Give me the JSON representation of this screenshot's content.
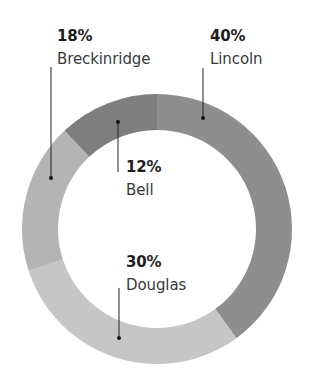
{
  "chart_data": {
    "type": "pie",
    "variant": "donut",
    "title": "",
    "start_angle_deg": 0,
    "direction": "clockwise",
    "center": [
      157,
      229
    ],
    "outer_radius": 135,
    "inner_radius": 99,
    "slices": [
      {
        "name": "Lincoln",
        "value": 40,
        "label": "40%",
        "color": "#8e8e8e",
        "label_pos": [
          210,
          29
        ],
        "leader": {
          "x": 203,
          "y1": 68,
          "y2": 118
        }
      },
      {
        "name": "Douglas",
        "value": 30,
        "label": "30%",
        "color": "#c6c6c6",
        "label_pos": [
          126,
          255
        ],
        "leader": {
          "x": 119,
          "y1": 288,
          "y2": 338
        }
      },
      {
        "name": "Breckinridge",
        "value": 18,
        "label": "18%",
        "color": "#b4b4b4",
        "label_pos": [
          57,
          29
        ],
        "leader": {
          "x": 51,
          "y1": 67,
          "y2": 178
        }
      },
      {
        "name": "Bell",
        "value": 12,
        "label": "12%",
        "color": "#7e7e7e",
        "label_pos": [
          126,
          160
        ],
        "leader": {
          "x": 118,
          "y1": 122,
          "y2": 172
        }
      }
    ],
    "legend": "none"
  },
  "labels": {
    "lincoln": {
      "pct": "40%",
      "name": "Lincoln"
    },
    "douglas": {
      "pct": "30%",
      "name": "Douglas"
    },
    "breckinridge": {
      "pct": "18%",
      "name": "Breckinridge"
    },
    "bell": {
      "pct": "12%",
      "name": "Bell"
    }
  }
}
